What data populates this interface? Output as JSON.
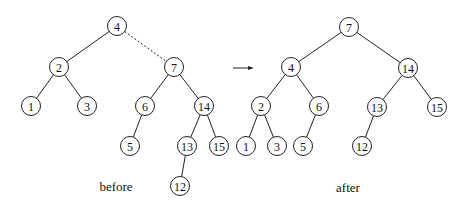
{
  "diagram": {
    "before": {
      "caption": "before",
      "caption_pos": [
        116,
        186
      ],
      "nodes": [
        {
          "id": "b4",
          "label": "4",
          "x": 117,
          "y": 26
        },
        {
          "id": "b2",
          "label": "2",
          "x": 59,
          "y": 67
        },
        {
          "id": "b7",
          "label": "7",
          "x": 174,
          "y": 67
        },
        {
          "id": "b1",
          "label": "1",
          "x": 31,
          "y": 106
        },
        {
          "id": "b3",
          "label": "3",
          "x": 87,
          "y": 106
        },
        {
          "id": "b6",
          "label": "6",
          "x": 145,
          "y": 106
        },
        {
          "id": "b14",
          "label": "14",
          "x": 204,
          "y": 106
        },
        {
          "id": "b5",
          "label": "5",
          "x": 130,
          "y": 146
        },
        {
          "id": "b13",
          "label": "13",
          "x": 187,
          "y": 146
        },
        {
          "id": "b15",
          "label": "15",
          "x": 219,
          "y": 146
        },
        {
          "id": "b12",
          "label": "12",
          "x": 180,
          "y": 186
        }
      ],
      "edges": [
        {
          "from": "b4",
          "to": "b2",
          "style": "solid"
        },
        {
          "from": "b4",
          "to": "b7",
          "style": "dashed"
        },
        {
          "from": "b2",
          "to": "b1",
          "style": "solid"
        },
        {
          "from": "b2",
          "to": "b3",
          "style": "solid"
        },
        {
          "from": "b7",
          "to": "b6",
          "style": "solid"
        },
        {
          "from": "b7",
          "to": "b14",
          "style": "solid"
        },
        {
          "from": "b6",
          "to": "b5",
          "style": "solid"
        },
        {
          "from": "b14",
          "to": "b13",
          "style": "solid"
        },
        {
          "from": "b14",
          "to": "b15",
          "style": "solid"
        },
        {
          "from": "b13",
          "to": "b12",
          "style": "solid"
        }
      ]
    },
    "arrow": {
      "x1": 233,
      "y1": 68,
      "x2": 254,
      "y2": 68
    },
    "after": {
      "caption": "after",
      "caption_pos": [
        348,
        187
      ],
      "nodes": [
        {
          "id": "a7",
          "label": "7",
          "x": 349,
          "y": 27
        },
        {
          "id": "a4",
          "label": "4",
          "x": 291,
          "y": 67
        },
        {
          "id": "a14",
          "label": "14",
          "x": 408,
          "y": 68
        },
        {
          "id": "a2",
          "label": "2",
          "x": 261,
          "y": 106
        },
        {
          "id": "a6",
          "label": "6",
          "x": 319,
          "y": 106
        },
        {
          "id": "a13",
          "label": "13",
          "x": 377,
          "y": 107
        },
        {
          "id": "a15",
          "label": "15",
          "x": 437,
          "y": 107
        },
        {
          "id": "a1",
          "label": "1",
          "x": 246,
          "y": 146
        },
        {
          "id": "a3",
          "label": "3",
          "x": 277,
          "y": 146
        },
        {
          "id": "a5",
          "label": "5",
          "x": 303,
          "y": 146
        },
        {
          "id": "a12",
          "label": "12",
          "x": 362,
          "y": 146
        }
      ],
      "edges": [
        {
          "from": "a7",
          "to": "a4",
          "style": "solid"
        },
        {
          "from": "a7",
          "to": "a14",
          "style": "solid"
        },
        {
          "from": "a4",
          "to": "a2",
          "style": "solid"
        },
        {
          "from": "a4",
          "to": "a6",
          "style": "solid"
        },
        {
          "from": "a14",
          "to": "a13",
          "style": "solid"
        },
        {
          "from": "a14",
          "to": "a15",
          "style": "solid"
        },
        {
          "from": "a2",
          "to": "a1",
          "style": "solid"
        },
        {
          "from": "a2",
          "to": "a3",
          "style": "solid"
        },
        {
          "from": "a6",
          "to": "a5",
          "style": "solid"
        },
        {
          "from": "a13",
          "to": "a12",
          "style": "solid"
        }
      ]
    },
    "node_radius": 9.5,
    "colors": {
      "stroke": "#222222",
      "text": "#111111",
      "background": "#ffffff"
    }
  }
}
